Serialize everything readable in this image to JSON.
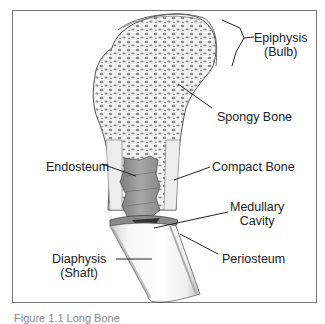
{
  "diagram": {
    "labels": {
      "epiphysis": {
        "line1": "Epiphysis",
        "line2": "(Bulb)"
      },
      "spongy_bone": "Spongy Bone",
      "endosteum": "Endosteum",
      "compact_bone": "Compact Bone",
      "medullary_cavity": {
        "line1": "Medullary",
        "line2": "Cavity"
      },
      "diaphysis": {
        "line1": "Diaphysis",
        "line2": "(Shaft)"
      },
      "periosteum": "Periosteum"
    },
    "colors": {
      "outline": "#555555",
      "spongy_fill": "#f2f2f2",
      "spongy_dots": "#8a8a8a",
      "cavity": "#9a9a9a",
      "shaft": "#f4f4f4",
      "label_line": "#222222"
    }
  },
  "caption": "Figure 1.1 Long Bone"
}
